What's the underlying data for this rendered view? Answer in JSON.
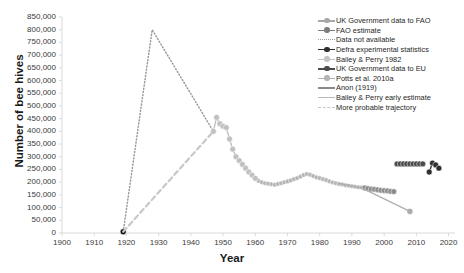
{
  "chart_data": {
    "type": "line",
    "title": "",
    "xlabel": "Year",
    "ylabel": "Number of bee hives",
    "xlim": [
      1900,
      2022
    ],
    "ylim": [
      0,
      850000
    ],
    "grid": false,
    "legend_position": "top-right",
    "xticks": [
      "1900",
      "1910",
      "1920",
      "1930",
      "1940",
      "1950",
      "1960",
      "1970",
      "1980",
      "1990",
      "2000",
      "2010",
      "2020"
    ],
    "yticks": [
      "0",
      "50,000",
      "100,000",
      "150,000",
      "200,000",
      "250,000",
      "300,000",
      "350,000",
      "400,000",
      "450,000",
      "500,000",
      "550,000",
      "600,000",
      "650,000",
      "700,000",
      "750,000",
      "800,000",
      "850,000"
    ],
    "series": [
      {
        "name": "UK Government data to FAO",
        "color": "#b4b4b4",
        "style": "solid-marker",
        "x": [
          1961,
          1962,
          1963,
          1964,
          1965,
          1966,
          1967,
          1968,
          1969,
          1970,
          1971,
          1972,
          1973,
          1974,
          1975,
          1976,
          1977,
          1978,
          1979,
          1980,
          1981,
          1982,
          1983,
          1984,
          1985,
          1986,
          1987,
          1988,
          1989,
          1990,
          1991,
          1992,
          1993
        ],
        "y": [
          205000,
          200000,
          196000,
          194000,
          192000,
          190000,
          193000,
          196000,
          200000,
          203000,
          207000,
          212000,
          216000,
          222000,
          228000,
          232000,
          229000,
          224000,
          219000,
          216000,
          212000,
          208000,
          203000,
          199000,
          196000,
          193000,
          191000,
          188000,
          186000,
          184000,
          182000,
          180000,
          179000
        ]
      },
      {
        "name": "FAO estimate",
        "color": "#8c8c8c",
        "style": "solid-marker",
        "x": [
          1994,
          1995,
          1996,
          1997,
          1998,
          1999,
          2000,
          2001,
          2002,
          2003
        ],
        "y": [
          177000,
          175000,
          173000,
          172000,
          170000,
          168000,
          167000,
          166000,
          164000,
          163000
        ]
      },
      {
        "name": "Data not available",
        "color": "#9a9a9a",
        "style": "dotted",
        "x": [
          1919,
          1928,
          1947
        ],
        "y": [
          5000,
          800000,
          400000
        ]
      },
      {
        "name": "Defra experimental statistics",
        "color": "#2e2e2e",
        "style": "solid-marker",
        "x": [
          2014,
          2015,
          2016,
          2017
        ],
        "y": [
          240000,
          275000,
          268000,
          255000
        ]
      },
      {
        "name": "Bailey & Perry 1982",
        "color": "#c0c0c0",
        "style": "solid-marker",
        "x": [
          1947,
          1948,
          1949,
          1950,
          1951,
          1952,
          1953,
          1954,
          1955,
          1956,
          1957,
          1958,
          1959,
          1960
        ],
        "y": [
          400000,
          455000,
          430000,
          420000,
          415000,
          370000,
          330000,
          300000,
          285000,
          270000,
          255000,
          240000,
          228000,
          215000
        ]
      },
      {
        "name": "UK Government data to EU",
        "color": "#4a4a4a",
        "style": "solid-marker",
        "x": [
          2004,
          2005,
          2006,
          2007,
          2008,
          2009,
          2010,
          2011,
          2012
        ],
        "y": [
          272000,
          272000,
          272000,
          272000,
          272000,
          272000,
          272000,
          272000,
          272000
        ]
      },
      {
        "name": "Potts et al. 2010a",
        "color": "#a8a8a8",
        "style": "marker-only",
        "x": [
          2008
        ],
        "y": [
          85000
        ]
      },
      {
        "name": "Anon (1919)",
        "color": "#111111",
        "style": "marker-only",
        "x": [
          1919
        ],
        "y": [
          5000
        ]
      },
      {
        "name": "Bailey & Perry early estimate",
        "color": "#b0b0b0",
        "style": "solid",
        "x": [
          1986,
          1993,
          2008
        ],
        "y": [
          195000,
          178000,
          85000
        ]
      },
      {
        "name": "More probable trajectory",
        "color": "#c8c8c8",
        "style": "dashed",
        "x": [
          1919,
          1947
        ],
        "y": [
          5000,
          400000
        ]
      }
    ],
    "legend_entries": [
      {
        "label": "UK Government data to FAO",
        "key": "line-dot",
        "color": "#a8a8a8"
      },
      {
        "label": "FAO estimate",
        "key": "line-dot",
        "color": "#7d7d7d"
      },
      {
        "label": "Data not available",
        "key": "dotted",
        "color": "#9a9a9a"
      },
      {
        "label": "Defra experimental statistics",
        "key": "line-dot",
        "color": "#2e2e2e"
      },
      {
        "label": "Bailey & Perry 1982",
        "key": "line-dot",
        "color": "#c4c4c4"
      },
      {
        "label": "UK Government data to EU",
        "key": "line-dot",
        "color": "#4a4a4a"
      },
      {
        "label": "Potts et al. 2010a",
        "key": "line-dot",
        "color": "#b4b4b4"
      },
      {
        "label": "Anon (1919)",
        "key": "solid",
        "color": "#8a8a8a"
      },
      {
        "label": "Bailey & Perry early estimate",
        "key": "solid",
        "color": "#b8b8b8"
      },
      {
        "label": "More probable trajectory",
        "key": "dashed",
        "color": "#c8c8c8"
      }
    ]
  }
}
